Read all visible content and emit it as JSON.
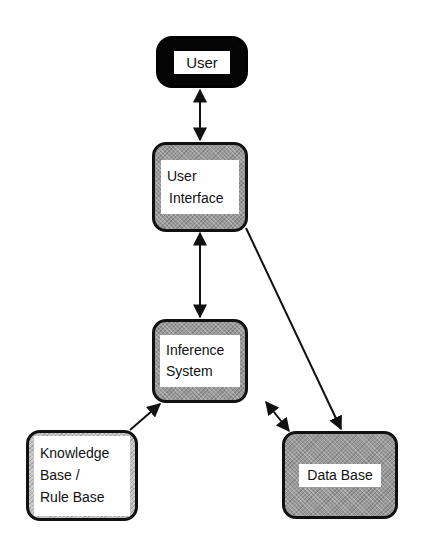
{
  "diagram": {
    "type": "architecture",
    "nodes": [
      {
        "id": "user",
        "lines": [
          "User"
        ],
        "style": "black"
      },
      {
        "id": "user_interface",
        "lines": [
          "User",
          "Interface"
        ],
        "style": "shaded"
      },
      {
        "id": "inference_system",
        "lines": [
          "Inference",
          "System"
        ],
        "style": "shaded"
      },
      {
        "id": "knowledge_base",
        "lines": [
          "Knowledge",
          "Base /",
          "Rule Base"
        ],
        "style": "light-shaded"
      },
      {
        "id": "data_base",
        "lines": [
          "Data Base"
        ],
        "style": "shaded"
      }
    ],
    "edges": [
      {
        "from": "user",
        "to": "user_interface",
        "direction": "both"
      },
      {
        "from": "user_interface",
        "to": "inference_system",
        "direction": "both"
      },
      {
        "from": "user_interface",
        "to": "data_base",
        "direction": "forward"
      },
      {
        "from": "knowledge_base",
        "to": "inference_system",
        "direction": "forward"
      },
      {
        "from": "inference_system",
        "to": "data_base",
        "direction": "both"
      }
    ]
  }
}
